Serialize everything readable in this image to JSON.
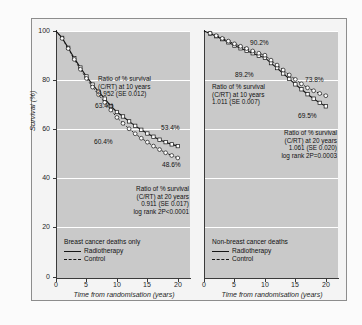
{
  "figure": {
    "background": "#fbfbfb",
    "plot_background": "#c9c9c9",
    "gridline_color": "#ffffff"
  },
  "chart_data": {
    "type": "line",
    "title": "",
    "xlabel": "Time from randomisation (years)",
    "ylabel": "Survival (%)",
    "xlim": [
      0,
      22
    ],
    "ylim": [
      0,
      100
    ],
    "xticks": [
      0,
      5,
      10,
      15,
      20
    ],
    "yticks": [
      0,
      20,
      40,
      60,
      80,
      100
    ],
    "grid": "horizontal",
    "legend_position": "inside-bottom-left",
    "panels": [
      {
        "name": "breast-cancer-deaths",
        "legend_title": "Breast cancer deaths only",
        "series": [
          {
            "name": "Radiotherapy",
            "style": "solid",
            "marker": "open-square",
            "x": [
              0,
              1,
              2,
              3,
              4,
              5,
              6,
              7,
              8,
              9,
              10,
              11,
              12,
              13,
              14,
              15,
              16,
              17,
              18,
              19,
              20
            ],
            "values": [
              100,
              97.2,
              93.2,
              89.0,
              85.2,
              81.6,
              78.3,
              75.4,
              72.6,
              69.6,
              67.2,
              65.4,
              63.4,
              61.6,
              60.0,
              58.5,
              57.2,
              56.0,
              55.0,
              54.1,
              53.4
            ]
          },
          {
            "name": "Control",
            "style": "dashed",
            "marker": "open-circle",
            "x": [
              0,
              1,
              2,
              3,
              4,
              5,
              6,
              7,
              8,
              9,
              10,
              11,
              12,
              13,
              14,
              15,
              16,
              17,
              18,
              19,
              20
            ],
            "values": [
              100,
              97.0,
              92.9,
              88.5,
              84.5,
              80.8,
              77.3,
              74.2,
              71.1,
              68.0,
              65.0,
              62.6,
              60.4,
              58.4,
              56.6,
              55.0,
              53.4,
              52.0,
              50.7,
              49.6,
              48.6
            ]
          }
        ],
        "point_labels": [
          {
            "text": "63.4%",
            "series": "Radiotherapy",
            "year": 12
          },
          {
            "text": "60.4%",
            "series": "Control",
            "year": 12
          },
          {
            "text": "53.4%",
            "series": "Radiotherapy",
            "year": 20
          },
          {
            "text": "48.6%",
            "series": "Control",
            "year": 20
          }
        ],
        "annotations": [
          {
            "id": "ratio-10y",
            "lines": [
              "Ratio of % survival",
              "(C/RT) at 10 years",
              "0.952 (SE 0.012)"
            ]
          },
          {
            "id": "ratio-20y",
            "lines": [
              "Ratio of % survival",
              "(C/RT) at 20 years",
              "0.911 (SE 0.017)",
              "log rank 2P<0.0001"
            ]
          }
        ]
      },
      {
        "name": "non-breast-cancer-deaths",
        "legend_title": "Non-breast cancer deaths",
        "series": [
          {
            "name": "Radiotherapy",
            "style": "solid",
            "marker": "open-square",
            "x": [
              0,
              1,
              2,
              3,
              4,
              5,
              6,
              7,
              8,
              9,
              10,
              11,
              12,
              13,
              14,
              15,
              16,
              17,
              18,
              19,
              20
            ],
            "values": [
              100,
              99.0,
              97.9,
              96.7,
              95.4,
              94.1,
              93.0,
              92.0,
              91.0,
              90.0,
              89.2,
              87.0,
              85.0,
              82.8,
              80.6,
              78.4,
              76.4,
              74.4,
              72.6,
              70.9,
              69.5
            ]
          },
          {
            "name": "Control",
            "style": "dashed",
            "marker": "open-circle",
            "x": [
              0,
              1,
              2,
              3,
              4,
              5,
              6,
              7,
              8,
              9,
              10,
              11,
              12,
              13,
              14,
              15,
              16,
              17,
              18,
              19,
              20
            ],
            "values": [
              100,
              99.1,
              98.1,
              97.0,
              95.9,
              94.8,
              93.8,
              92.9,
              91.9,
              91.0,
              90.2,
              88.2,
              86.2,
              84.2,
              82.2,
              80.4,
              78.6,
              77.0,
              75.8,
              74.7,
              73.8
            ]
          }
        ],
        "point_labels": [
          {
            "text": "90.2%",
            "series": "Control",
            "year": 10
          },
          {
            "text": "89.2%",
            "series": "Radiotherapy",
            "year": 10
          },
          {
            "text": "73.8%",
            "series": "Control",
            "year": 20
          },
          {
            "text": "69.5%",
            "series": "Radiotherapy",
            "year": 20
          }
        ],
        "annotations": [
          {
            "id": "ratio-10y",
            "lines": [
              "Ratio of % survival",
              "(C/RT) at 10 years",
              "1.011 (SE 0.007)"
            ]
          },
          {
            "id": "ratio-20y",
            "lines": [
              "Ratio of % survival",
              "(C/RT) at 20 years",
              "1.061 (SE 0.020)",
              "log rank 2P=0.0003"
            ]
          }
        ]
      }
    ]
  },
  "left_panel": {
    "yticks": [
      "100",
      "80",
      "60",
      "40",
      "20",
      "0"
    ],
    "xticks": [
      "0",
      "5",
      "10",
      "15",
      "20"
    ],
    "ylabel": "Survival (%)",
    "xlabel": "Time from randomisation (years)",
    "legend_title": "Breast cancer deaths only",
    "legend_rt": "Radiotherapy",
    "legend_control": "Control",
    "annot_10y": "Ratio of % survival\n(C/RT) at 10 years\n0.952 (SE 0.012)",
    "annot_20y": "Ratio of % survival\n(C/RT) at 20 years\n0.911 (SE 0.017)\nlog rank 2P<0.0001",
    "label_rt_10y": "63.4%",
    "label_ctl_10y": "60.4%",
    "label_rt_20y": "53.4%",
    "label_ctl_20y": "48.6%"
  },
  "right_panel": {
    "xticks": [
      "0",
      "5",
      "10",
      "15",
      "20"
    ],
    "xlabel": "Time from randomisation (years)",
    "legend_title": "Non-breast cancer deaths",
    "legend_rt": "Radiotherapy",
    "legend_control": "Control",
    "annot_10y": "Ratio of % survival\n(C/RT) at 10 years\n1.011 (SE 0.007)",
    "annot_20y": "Ratio of % survival\n(C/RT) at 20 years\n1.061 (SE 0.020)\nlog rank 2P=0.0003",
    "label_ctl_10y": "90.2%",
    "label_rt_10y": "89.2%",
    "label_ctl_20y": "73.8%",
    "label_rt_20y": "69.5%"
  }
}
